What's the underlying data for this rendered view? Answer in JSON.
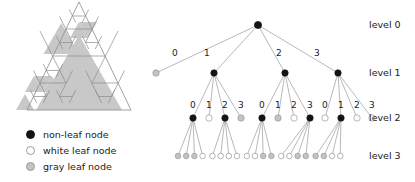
{
  "figure": {
    "title": "",
    "left_panel": {
      "name": "recursive-triangle-subdivision",
      "description": "Sierpinski-style triangle recursively split into four sub-triangles; gray cells are occupied, white cells are empty",
      "fill_gray": "#c8c8c8",
      "stroke": "#8c8c8c"
    }
  },
  "legend": {
    "items": [
      {
        "key": "non-leaf",
        "marker": "black-filled-circle",
        "label": "non-leaf node"
      },
      {
        "key": "white-leaf",
        "marker": "white-circle",
        "label": "white leaf node"
      },
      {
        "key": "gray-leaf",
        "marker": "gray-circle",
        "label": "gray leaf node"
      }
    ]
  },
  "levels": [
    {
      "id": "level0",
      "label": "level 0",
      "y": 25
    },
    {
      "id": "level1",
      "label": "level 1",
      "y": 73
    },
    {
      "id": "level2",
      "label": "level 2",
      "y": 118
    },
    {
      "id": "level3",
      "label": "level 3",
      "y": 156
    }
  ],
  "tree": {
    "colors": {
      "black": "#141414",
      "white": "#ffffff",
      "gray": "#c3c3c3",
      "edge": "#9a9a9a",
      "ring": "#9a9a9a"
    },
    "root": {
      "x": 258,
      "y": 25,
      "type": "black"
    },
    "level1": {
      "edge_labels": [
        "0",
        "1",
        "2",
        "3"
      ],
      "nodes": [
        {
          "x": 156,
          "y": 73,
          "type": "gray",
          "label": "0"
        },
        {
          "x": 214,
          "y": 73,
          "type": "black",
          "label": "1"
        },
        {
          "x": 285,
          "y": 73,
          "type": "black",
          "label": "2"
        },
        {
          "x": 338,
          "y": 73,
          "type": "black",
          "label": "3"
        }
      ]
    },
    "level2": {
      "groups": [
        {
          "parent": 1,
          "edge_labels": [
            "0",
            "1",
            "2",
            "3"
          ],
          "nodes": [
            {
              "x": 193,
              "y": 118,
              "type": "black"
            },
            {
              "x": 209,
              "y": 118,
              "type": "white"
            },
            {
              "x": 225,
              "y": 118,
              "type": "black"
            },
            {
              "x": 241,
              "y": 118,
              "type": "gray"
            }
          ]
        },
        {
          "parent": 2,
          "edge_labels": [
            "0",
            "1",
            "2",
            "3"
          ],
          "nodes": [
            {
              "x": 262,
              "y": 118,
              "type": "black"
            },
            {
              "x": 278,
              "y": 118,
              "type": "gray"
            },
            {
              "x": 294,
              "y": 118,
              "type": "white"
            },
            {
              "x": 310,
              "y": 118,
              "type": "black"
            }
          ]
        },
        {
          "parent": 3,
          "edge_labels": [
            "0",
            "1",
            "2",
            "3"
          ],
          "nodes": [
            {
              "x": 325,
              "y": 118,
              "type": "white"
            },
            {
              "x": 341,
              "y": 118,
              "type": "black"
            },
            {
              "x": 357,
              "y": 118,
              "type": "white"
            },
            {
              "x": 372,
              "y": 118,
              "type": "white"
            }
          ]
        }
      ]
    },
    "level3": {
      "groups": [
        {
          "parent_x": 193,
          "types": [
            "gray",
            "gray",
            "gray",
            "white"
          ]
        },
        {
          "parent_x": 225,
          "types": [
            "white",
            "white",
            "white",
            "white"
          ]
        },
        {
          "parent_x": 262,
          "types": [
            "white",
            "white",
            "gray",
            "gray"
          ]
        },
        {
          "parent_x": 310,
          "types": [
            "white",
            "white",
            "gray",
            "gray"
          ]
        },
        {
          "parent_x": 341,
          "types": [
            "gray",
            "gray",
            "white",
            "white"
          ]
        }
      ],
      "y": 156
    }
  }
}
